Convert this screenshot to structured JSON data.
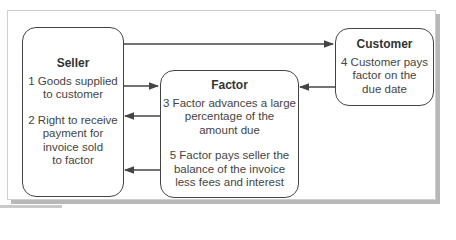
{
  "diagram": {
    "type": "flowchart",
    "title": "",
    "nodes": [
      {
        "id": "seller",
        "title": "Seller",
        "paragraphs": [
          "1 Goods supplied\nto customer",
          "2 Right to receive\npayment for\ninvoice sold\nto factor"
        ]
      },
      {
        "id": "factor",
        "title": "Factor",
        "paragraphs": [
          "3 Factor advances a large\npercentage of the\namount due",
          "5 Factor pays seller the\nbalance of the invoice\nless fees and interest"
        ]
      },
      {
        "id": "customer",
        "title": "Customer",
        "paragraphs": [
          "4 Customer pays\nfactor on the\ndue date"
        ]
      }
    ],
    "edges": [
      {
        "from": "seller",
        "to": "customer",
        "label": "1 Goods supplied to customer"
      },
      {
        "from": "seller",
        "to": "factor",
        "label": "2 Right to receive payment for invoice sold to factor"
      },
      {
        "from": "factor",
        "to": "seller",
        "label": "3 Factor advances a large percentage of the amount due"
      },
      {
        "from": "customer",
        "to": "factor",
        "label": "4 Customer pays factor on the due date"
      },
      {
        "from": "factor",
        "to": "seller",
        "label": "5 Factor pays seller the balance of the invoice less fees and interest"
      }
    ],
    "colors": {
      "stroke": "#444444",
      "frame_border": "#cfcfcf",
      "shadow": "#b8b8b8",
      "text": "#333333"
    }
  }
}
